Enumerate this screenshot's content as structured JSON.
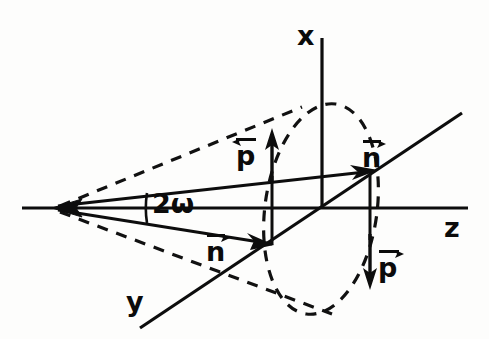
{
  "figure": {
    "domain": "Diagram",
    "background_color": "#fdfdfc",
    "ink_color": "#0b0b0b",
    "width": 489,
    "height": 339
  },
  "axes": [
    {
      "id": "x",
      "label": "x",
      "label_x": 297,
      "label_y": 22,
      "orientation": "vertical-up",
      "from": [
        322,
        208
      ],
      "to": [
        322,
        38
      ],
      "style": "solid"
    },
    {
      "id": "z",
      "label": "z",
      "label_x": 444,
      "label_y": 214,
      "orientation": "horizontal-right",
      "from": [
        22,
        208
      ],
      "to": [
        468,
        208
      ],
      "style": "solid"
    },
    {
      "id": "y",
      "label": "y",
      "label_x": 126,
      "label_y": 288,
      "orientation": "oblique-down-left",
      "from": [
        462,
        113
      ],
      "to": [
        140,
        328
      ],
      "style": "solid"
    }
  ],
  "apex": {
    "label": "cone-apex",
    "x": 56,
    "y": 208,
    "arrowhead": "left"
  },
  "angle": {
    "label": "2ω",
    "label_x": 152,
    "label_y": 190,
    "description": "full opening angle of the cone",
    "arc_center": [
      56,
      208
    ],
    "arc_radius": 92
  },
  "ellipse": {
    "name": "cone-base-ellipse",
    "style": "dashed",
    "center": [
      321,
      209
    ],
    "rx": 56,
    "ry": 106,
    "rotation_deg": 8
  },
  "cone_lines": [
    {
      "name": "upper-solid-generator",
      "from": [
        56,
        208
      ],
      "to": [
        372,
        172
      ],
      "style": "solid"
    },
    {
      "name": "lower-solid-generator",
      "from": [
        56,
        208
      ],
      "to": [
        268,
        243
      ],
      "style": "solid"
    },
    {
      "name": "upper-dashed-generator",
      "from": [
        56,
        208
      ],
      "to": [
        300,
        108
      ],
      "style": "dashed"
    },
    {
      "name": "lower-dashed-generator",
      "from": [
        56,
        208
      ],
      "to": [
        330,
        312
      ],
      "style": "dashed"
    }
  ],
  "vectors": [
    {
      "name": "n-upper",
      "label": "n",
      "accent": "vector-arrow-right",
      "label_x": 362,
      "label_y": 140,
      "tip": [
        372,
        172
      ],
      "direction": "along-generator-up-right"
    },
    {
      "name": "p-upper",
      "label": "p",
      "accent": "vector-arrow-left",
      "label_x": 236,
      "label_y": 138,
      "tip": [
        272,
        133
      ],
      "tail": [
        272,
        180
      ],
      "direction": "up"
    },
    {
      "name": "n-lower",
      "label": "n",
      "accent": "vector-arrow-right",
      "label_x": 206,
      "label_y": 234,
      "tip": [
        268,
        243
      ],
      "direction": "along-generator-down-right"
    },
    {
      "name": "p-lower",
      "label": "p",
      "accent": "vector-arrow-right",
      "label_x": 378,
      "label_y": 250,
      "tip": [
        369,
        286
      ],
      "tail": [
        369,
        238
      ],
      "direction": "down"
    }
  ],
  "projection_lines": [
    {
      "name": "upper-vertical-drop",
      "from": [
        272,
        180
      ],
      "to": [
        272,
        243
      ]
    },
    {
      "name": "right-vertical-drop",
      "from": [
        370,
        172
      ],
      "to": [
        370,
        238
      ]
    }
  ]
}
